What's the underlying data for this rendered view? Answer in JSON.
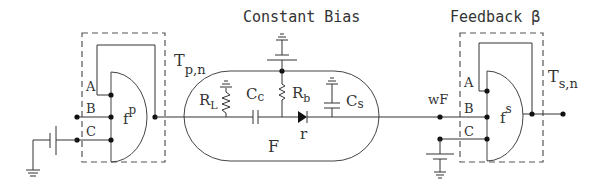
{
  "titles": {
    "center": "Constant Bias",
    "right": "Feedback β"
  },
  "left_block": {
    "function": "f",
    "function_sup": "p",
    "output_label": "T",
    "output_sub": "p,n",
    "pins": [
      "A",
      "B",
      "C"
    ]
  },
  "center_block": {
    "name": "F",
    "components": {
      "load_resistor": "R",
      "load_resistor_sub": "L",
      "coupling_cap": "C",
      "coupling_cap_sub": "c",
      "bias_resistor": "R",
      "bias_resistor_sub": "b",
      "shunt_cap": "C",
      "shunt_cap_sub": "s",
      "diode": "r"
    }
  },
  "right_block": {
    "input_label": "wF",
    "function": "f",
    "function_sup": "s",
    "output_label": "T",
    "output_sub": "s,n",
    "pins": [
      "A",
      "B",
      "C"
    ]
  }
}
